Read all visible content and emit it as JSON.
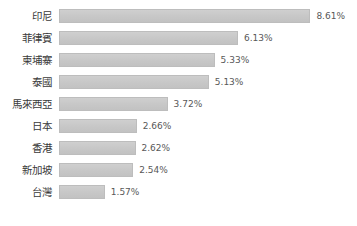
{
  "chart_data": {
    "type": "bar",
    "orientation": "horizontal",
    "title": "",
    "subtitle": "",
    "xlabel": "",
    "ylabel": "",
    "grid": false,
    "legend": null,
    "axis_visible": false,
    "xlim": [
      0,
      8.61
    ],
    "units": "%",
    "categories": [
      "印尼",
      "菲律賓",
      "柬埔寨",
      "泰國",
      "馬來西亞",
      "日本",
      "香港",
      "新加坡",
      "台灣"
    ],
    "values": [
      8.61,
      6.13,
      5.33,
      5.13,
      3.72,
      2.66,
      2.62,
      2.54,
      1.57
    ],
    "data_labels": [
      "8.61%",
      "6.13%",
      "5.33%",
      "5.13%",
      "3.72%",
      "2.66%",
      "2.62%",
      "2.54%",
      "1.57%"
    ],
    "bars": [
      {
        "label": "印尼",
        "value": 8.61,
        "display": "8.61%"
      },
      {
        "label": "菲律賓",
        "value": 6.13,
        "display": "6.13%"
      },
      {
        "label": "柬埔寨",
        "value": 5.33,
        "display": "5.33%"
      },
      {
        "label": "泰國",
        "value": 5.13,
        "display": "5.13%"
      },
      {
        "label": "馬來西亞",
        "value": 3.72,
        "display": "3.72%"
      },
      {
        "label": "日本",
        "value": 2.66,
        "display": "2.66%"
      },
      {
        "label": "香港",
        "value": 2.62,
        "display": "2.62%"
      },
      {
        "label": "新加坡",
        "value": 2.54,
        "display": "2.54%"
      },
      {
        "label": "台灣",
        "value": 1.57,
        "display": "1.57%"
      }
    ],
    "colors": {
      "bar_fill": "#c9c9c9",
      "bar_border": "#bdbdbd",
      "label_text": "#3a3a3a",
      "value_text": "#585858",
      "background": "#ffffff"
    }
  }
}
